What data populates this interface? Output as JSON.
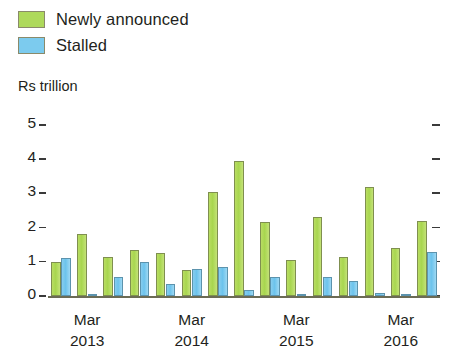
{
  "legend": {
    "items": [
      {
        "label": "Newly announced",
        "color": "#aed95b",
        "key": "newly_announced"
      },
      {
        "label": "Stalled",
        "color": "#7ccbee",
        "key": "stalled"
      }
    ]
  },
  "axis_title": "Rs trillion",
  "chart_data": {
    "type": "bar",
    "title": "",
    "subtitle": "",
    "xlabel": "",
    "ylabel": "Rs trillion",
    "ylim": [
      0,
      5
    ],
    "yticks": [
      0,
      1,
      2,
      3,
      4,
      5
    ],
    "ytick_labels": [
      "0",
      "1",
      "2",
      "3",
      "4",
      "5"
    ],
    "grid": false,
    "legend_position": "top-left",
    "right_axis_ticks": [
      0,
      1,
      2,
      3,
      4,
      5
    ],
    "categories": [
      "Dec 2012",
      "Mar 2013",
      "Jun 2013",
      "Sep 2013",
      "Dec 2013",
      "Mar 2014",
      "Jun 2014",
      "Sep 2014",
      "Dec 2014",
      "Mar 2015",
      "Jun 2015",
      "Sep 2015",
      "Dec 2015",
      "Mar 2016",
      "Jun 2016"
    ],
    "xtick_labels": [
      {
        "line1": "Mar",
        "line2": "2013"
      },
      {
        "line1": "Mar",
        "line2": "2014"
      },
      {
        "line1": "Mar",
        "line2": "2015"
      },
      {
        "line1": "Mar",
        "line2": "2016"
      }
    ],
    "xtick_category_index": [
      1,
      5,
      9,
      13
    ],
    "series": [
      {
        "name": "Newly announced",
        "color": "#aed95b",
        "values": [
          1.0,
          1.8,
          1.15,
          1.35,
          1.25,
          0.75,
          3.05,
          3.95,
          2.15,
          1.05,
          2.3,
          1.15,
          3.2,
          1.4,
          2.2
        ]
      },
      {
        "name": "Stalled",
        "color": "#7ccbee",
        "values": [
          1.1,
          0.05,
          0.55,
          1.0,
          0.35,
          0.78,
          0.85,
          0.18,
          0.55,
          0.02,
          0.55,
          0.45,
          0.08,
          0.05,
          1.3
        ]
      }
    ]
  }
}
